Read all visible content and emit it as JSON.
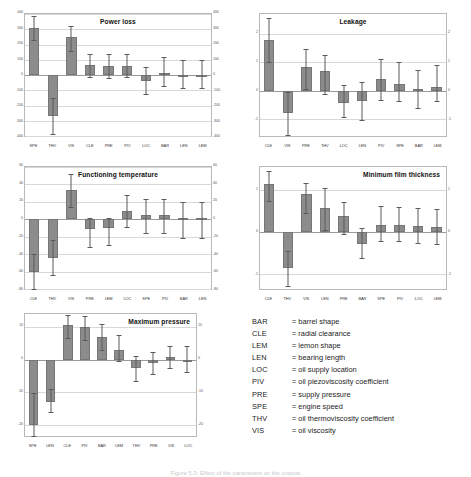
{
  "caption": "Figure 5.3: Effect of the parameters on the outputs",
  "colors": {
    "bar": "#8c8c8c",
    "whisker": "#5a5a5a",
    "grid": "#d8d8d8",
    "frame": "#b9b9b9"
  },
  "legend": {
    "name": "parameter-abbreviation-legend",
    "rows": [
      {
        "key": "BAR",
        "eq": "=",
        "text": "= barrel shape"
      },
      {
        "key": "CLE",
        "eq": "=",
        "text": "= radial clearance"
      },
      {
        "key": "LEM",
        "eq": "=",
        "text": "= lemon shape"
      },
      {
        "key": "LEN",
        "eq": "=",
        "text": "= bearing length"
      },
      {
        "key": "LOC",
        "eq": "=",
        "text": "= oil supply location"
      },
      {
        "key": "PIV",
        "eq": "=",
        "text": "= oil piezoviscosity coefficient"
      },
      {
        "key": "PRE",
        "eq": "=",
        "text": "= supply pressure"
      },
      {
        "key": "SPE",
        "eq": "=",
        "text": "= engine speed"
      },
      {
        "key": "THV",
        "eq": "=",
        "text": "= oil thermoviscosity coefficient"
      },
      {
        "key": "VIS",
        "eq": "=",
        "text": "= oil viscosity"
      }
    ]
  },
  "chart_data": [
    {
      "id": "power-loss",
      "type": "bar",
      "title": "Power loss",
      "title_align": "center",
      "categories": [
        "SPE",
        "THV",
        "VIS",
        "CLE",
        "PRE",
        "PIV",
        "LOC",
        "BAR",
        "LEN",
        "LEM"
      ],
      "values": [
        310,
        -270,
        250,
        68,
        62,
        62,
        -40,
        12,
        3,
        3
      ],
      "err_low": [
        230,
        -390,
        160,
        -10,
        -18,
        -15,
        -125,
        -70,
        -85,
        -85
      ],
      "err_high": [
        390,
        -150,
        320,
        135,
        140,
        140,
        50,
        120,
        100,
        100
      ],
      "ylim": [
        -400,
        400
      ],
      "yticks": [
        400,
        300,
        200,
        100,
        0,
        -100,
        -200,
        -300,
        -400
      ],
      "ylabel": "",
      "xlabel": "",
      "grid": true,
      "dual_axis": true
    },
    {
      "id": "leakage",
      "type": "bar",
      "title": "Leakage",
      "title_align": "center",
      "categories": [
        "CLE",
        "VIS",
        "PRE",
        "THV",
        "LOC",
        "LEN",
        "PIV",
        "SPE",
        "BAR",
        "LEM"
      ],
      "values": [
        1.8,
        -0.8,
        0.82,
        0.68,
        -0.42,
        -0.36,
        0.4,
        0.25,
        0.05,
        0.12
      ],
      "err_low": [
        1.02,
        -1.55,
        0.05,
        -0.13,
        -0.92,
        -1.05,
        -0.32,
        -0.38,
        -0.62,
        -0.35
      ],
      "err_high": [
        2.55,
        -0.05,
        1.48,
        1.25,
        0.2,
        0.3,
        1.1,
        1.0,
        0.72,
        0.92
      ],
      "ylim": [
        -1.6,
        2.7
      ],
      "yticks": [
        2,
        1,
        0,
        -1
      ],
      "ylabel": "",
      "xlabel": "",
      "grid": true,
      "dual_axis": true
    },
    {
      "id": "functioning-temperature",
      "type": "bar",
      "title": "Functioning temperature",
      "title_align": "center",
      "categories": [
        "CLE",
        "THV",
        "VIS",
        "PRE",
        "LEM",
        "LOC",
        "SPE",
        "PIV",
        "BAR",
        "LEN"
      ],
      "values": [
        -60,
        -44,
        34,
        -11,
        -10,
        10,
        5,
        5,
        2,
        2
      ],
      "err_low": [
        -80,
        -64,
        14,
        -32,
        -30,
        -9,
        -16,
        -16,
        -22,
        -22
      ],
      "err_high": [
        -40,
        -24,
        52,
        1,
        2,
        28,
        23,
        23,
        20,
        20
      ],
      "ylim": [
        -80,
        60
      ],
      "yticks": [
        60,
        40,
        20,
        0,
        -20,
        -40,
        -60,
        -80
      ],
      "ylabel": "",
      "xlabel": "",
      "grid": true,
      "dual_axis": true
    },
    {
      "id": "minimum-film-thickness",
      "type": "bar",
      "title": "Minimum film thickness",
      "title_align": "right",
      "categories": [
        "CLE",
        "THV",
        "VIS",
        "LEN",
        "PRE",
        "BAR",
        "SPE",
        "PIV",
        "LOC",
        "LEM"
      ],
      "values": [
        1.15,
        -0.85,
        0.9,
        0.58,
        0.38,
        -0.28,
        0.18,
        0.18,
        0.15,
        0.12
      ],
      "err_low": [
        0.75,
        -1.28,
        0.46,
        0.05,
        -0.05,
        -0.62,
        -0.2,
        -0.22,
        -0.25,
        -0.28
      ],
      "err_high": [
        1.45,
        -0.45,
        1.18,
        1.05,
        0.72,
        0.1,
        0.62,
        0.6,
        0.58,
        0.55
      ],
      "ylim": [
        -1.35,
        1.55
      ],
      "yticks": [
        1,
        0,
        -1
      ],
      "ylabel": "",
      "xlabel": "",
      "grid": true,
      "dual_axis": true
    },
    {
      "id": "maximum-pressure",
      "type": "bar",
      "title": "Maximum pressure",
      "title_align": "right",
      "categories": [
        "SPE",
        "LEN",
        "CLE",
        "PIV",
        "BAR",
        "LEM",
        "THV",
        "PRE",
        "VIS",
        "LOC"
      ],
      "values": [
        -20,
        -13,
        10.5,
        10,
        7,
        3,
        -2.5,
        -1,
        0.8,
        0
      ],
      "err_low": [
        -23.5,
        -16,
        6.5,
        6,
        3,
        -0.5,
        -6.5,
        -4.5,
        -2.5,
        -3.8
      ],
      "err_high": [
        -10.2,
        -9.2,
        13.8,
        13.5,
        11,
        7.5,
        1.2,
        2.2,
        4.2,
        4.2
      ],
      "ylim": [
        -23.5,
        14
      ],
      "yticks": [
        10,
        0,
        -10,
        -20
      ],
      "ylabel": "",
      "xlabel": "",
      "grid": true,
      "dual_axis": true
    }
  ]
}
